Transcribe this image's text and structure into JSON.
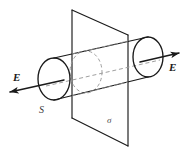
{
  "figure": {
    "background_color": "#ffffff",
    "stroke_color": "#1a1a1a",
    "dashed_color": "#8c8c8c",
    "labels": {
      "field_left": "E",
      "field_right": "E",
      "gaussian_surface": "S",
      "charge_plane": "σ"
    },
    "elements": {
      "cylinder_name": "gaussian-cylinder",
      "plane_name": "charged-plane",
      "axis_name": "cylinder-axis",
      "left_cap_name": "cylinder-left-cap",
      "right_cap_name": "cylinder-right-cap",
      "mid_ellipse_name": "cylinder-plane-intersection"
    },
    "geometry": {
      "left_cap_center": [
        54,
        79
      ],
      "left_cap_rx": 16,
      "left_cap_ry": 21,
      "right_cap_center": [
        148,
        57
      ],
      "right_cap_rx": 15,
      "right_cap_ry": 20,
      "mid_ellipse_center": [
        86,
        72
      ],
      "plane_vertices": [
        [
          72,
          10
        ],
        [
          128,
          35
        ],
        [
          128,
          146
        ],
        [
          72,
          118
        ]
      ],
      "arrow_left_tip": [
        7,
        93
      ],
      "arrow_right_tip": [
        183,
        52
      ]
    }
  }
}
